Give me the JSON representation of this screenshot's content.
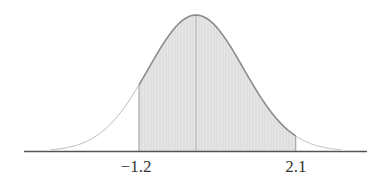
{
  "chart_data": {
    "type": "area",
    "title": "",
    "subtitle": "",
    "xlabel": "",
    "ylabel": "",
    "distribution": "normal",
    "mean": 0,
    "std": 1,
    "shaded_region": {
      "from": -1.2,
      "to": 2.1
    },
    "tick_labels": [
      {
        "value": -1.2,
        "label": "−1.2"
      },
      {
        "value": 2.1,
        "label": "2.1"
      }
    ],
    "xlim": [
      -3.0,
      3.0
    ],
    "grid": false,
    "legend": null,
    "colors": {
      "curve": "#8c8c8c",
      "tail_curve": "#b8b8b8",
      "shade_fill": "#e6e6e6",
      "hatch": "#d2d2d2",
      "axis": "#555555",
      "boundary": "#9a9a9a",
      "center_line": "#b0b0b0"
    }
  }
}
